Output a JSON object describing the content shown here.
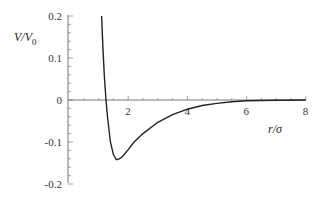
{
  "chart_data": {
    "type": "line",
    "title": "",
    "xlabel": "r/σ",
    "ylabel": "V/V0",
    "xlim": [
      0,
      8
    ],
    "ylim": [
      -0.2,
      0.2
    ],
    "x_ticks": [
      "2",
      "4",
      "6",
      "8"
    ],
    "y_ticks": [
      "0.2",
      "0.1",
      "0",
      "-0.1",
      "-0.2"
    ],
    "grid": false,
    "legend": null,
    "series": [
      {
        "name": "V/V0",
        "x": [
          1.1,
          1.15,
          1.2,
          1.25,
          1.3,
          1.4,
          1.5,
          1.6,
          1.7,
          1.8,
          2.0,
          2.2,
          2.5,
          3.0,
          3.5,
          4.0,
          4.5,
          5.0,
          5.5,
          6.0,
          7.0,
          8.0
        ],
        "y": [
          0.2,
          0.12,
          0.05,
          0.0,
          -0.04,
          -0.1,
          -0.13,
          -0.142,
          -0.14,
          -0.135,
          -0.118,
          -0.1,
          -0.08,
          -0.053,
          -0.035,
          -0.022,
          -0.013,
          -0.008,
          -0.004,
          -0.002,
          -0.0005,
          0.0
        ]
      }
    ]
  },
  "labels": {
    "ylabel_main": "V/V",
    "ylabel_sub": "0",
    "xlabel": "r/σ"
  }
}
